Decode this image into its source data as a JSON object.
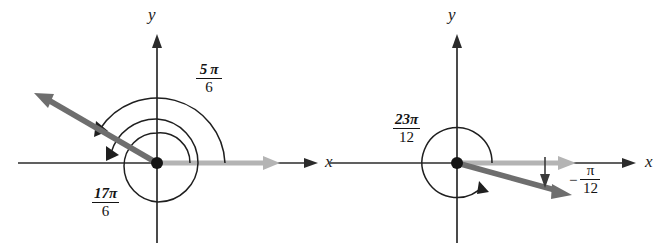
{
  "figure": {
    "domain": "Diagram",
    "description_kind": "coterminal-angles-standard-position",
    "background_color": "#ffffff",
    "ink_color": "#1a1a1a",
    "initial_side_color": "#b4b4b4",
    "terminal_side_color": "#6e6e6e",
    "panels": [
      {
        "id": "left",
        "origin": {
          "x": 157,
          "y": 163
        },
        "axes": {
          "x_label": "x",
          "y_label": "y"
        },
        "terminal_angle_deg": 150,
        "labels": [
          {
            "id": "five-pi-over-six",
            "numerator": "5 π",
            "denominator": "6",
            "text": "5π/6",
            "x": 196,
            "y": 62
          },
          {
            "id": "seventeen-pi-over-six",
            "numerator": "17π",
            "denominator": "6",
            "text": "17π/6",
            "x": 92,
            "y": 186
          }
        ],
        "arcs": [
          {
            "id": "outer-arc-5pi-6",
            "radius": 68,
            "sweep_label": "5π/6"
          },
          {
            "id": "inner-arc-17pi-6",
            "radius": 43,
            "sweep_label": "17π/6"
          },
          {
            "id": "innermost-arc-17pi-6",
            "radius": 28,
            "sweep_label": "17π/6"
          }
        ]
      },
      {
        "id": "right",
        "origin": {
          "x": 457,
          "y": 163
        },
        "axes": {
          "x_label": "x",
          "y_label": "y"
        },
        "terminal_angle_deg": -15,
        "labels": [
          {
            "id": "twentythree-pi-over-twelve",
            "numerator": "23π",
            "denominator": "12",
            "text": "23π/12",
            "x": 393,
            "y": 112
          },
          {
            "id": "negative-pi-over-twelve",
            "sign": "−",
            "numerator": "π",
            "denominator": "12",
            "text": "−π/12",
            "x": 569,
            "y": 163
          }
        ],
        "arcs": [
          {
            "id": "circle-arc-23pi-12",
            "radius": 35,
            "sweep_label": "23π/12"
          },
          {
            "id": "small-arc-neg-pi-12",
            "radius": 0,
            "sweep_label": "−π/12"
          }
        ]
      }
    ]
  }
}
